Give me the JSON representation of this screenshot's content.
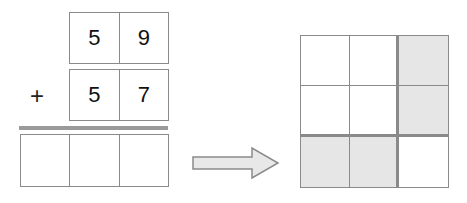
{
  "addition": {
    "operator": "+",
    "addend1": [
      "5",
      "9"
    ],
    "addend2": [
      "5",
      "7"
    ],
    "result": [
      "",
      "",
      ""
    ]
  },
  "arrow": {
    "direction": "right"
  },
  "grid": {
    "rows": 3,
    "cols": 3,
    "shaded_cells": [
      [
        0,
        2
      ],
      [
        1,
        2
      ],
      [
        2,
        0
      ],
      [
        2,
        1
      ]
    ],
    "colors": {
      "shade": "#e6e6e6",
      "line": "#8a8a8a"
    }
  }
}
